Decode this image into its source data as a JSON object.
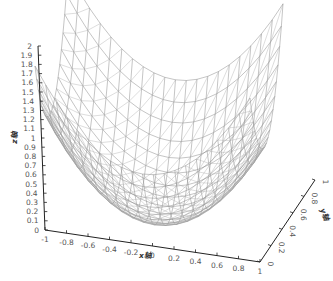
{
  "chart_data": {
    "type": "surface-wireframe-3d",
    "title": "",
    "function": "z = x^2 + y^2",
    "xlabel": "x轴",
    "ylabel": "y轴",
    "zlabel": "z轴",
    "x_ticks": [
      "-1",
      "-0.8",
      "-0.6",
      "-0.4",
      "-0.2",
      "0",
      "0.2",
      "0.4",
      "0.6",
      "0.8",
      "1"
    ],
    "y_ticks": [
      "0",
      "0.2",
      "0.4",
      "0.6",
      "0.8",
      "1"
    ],
    "z_ticks": [
      "0",
      "0.1",
      "0.2",
      "0.3",
      "0.4",
      "0.5",
      "0.6",
      "0.7",
      "0.8",
      "0.9",
      "1",
      "1.1",
      "1.2",
      "1.3",
      "1.4",
      "1.5",
      "1.6",
      "1.7",
      "1.8",
      "1.9",
      "2"
    ],
    "xlim": [
      -1,
      1
    ],
    "ylim": [
      -1,
      1
    ],
    "zlim": [
      0,
      2
    ],
    "grid": false,
    "legend": "none",
    "mesh_color": "#8a8a8a",
    "axis_color": "#222222"
  }
}
